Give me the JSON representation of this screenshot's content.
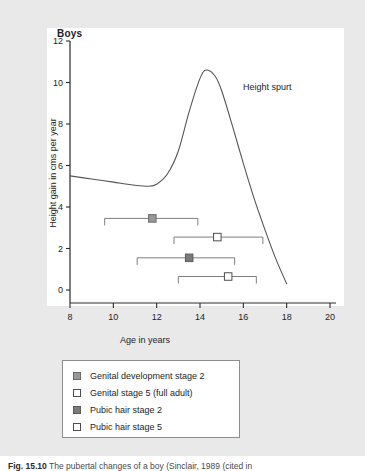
{
  "figure": {
    "title": "Boys",
    "caption_prefix": "Fig. 15.10",
    "caption_text": "The pubertal changes of a boy (Sinclair, 1989 (cited in"
  },
  "chart_data": {
    "type": "line",
    "title": "Boys",
    "xlabel": "Age in years",
    "ylabel": "Height gain in cms per year",
    "xlim": [
      8,
      20
    ],
    "ylim": [
      0,
      12
    ],
    "xticks": [
      8,
      10,
      12,
      14,
      16,
      18,
      20
    ],
    "yticks": [
      0,
      2,
      4,
      6,
      8,
      10,
      12
    ],
    "grid": false,
    "legend_position": "below-plot",
    "annotations": [
      {
        "text": "Height spurt",
        "x": 16.2,
        "y": 9.6
      }
    ],
    "series": [
      {
        "name": "Height velocity curve",
        "type": "line",
        "color": "#555555",
        "x": [
          8.0,
          9.0,
          10.0,
          11.0,
          11.6,
          12.0,
          12.5,
          13.0,
          13.5,
          14.0,
          14.3,
          14.7,
          15.0,
          15.5,
          16.0,
          16.5,
          17.0,
          17.5,
          18.0
        ],
        "y": [
          5.5,
          5.35,
          5.2,
          5.05,
          5.0,
          5.1,
          5.6,
          6.7,
          8.6,
          10.2,
          10.6,
          10.3,
          9.6,
          7.9,
          6.1,
          4.4,
          2.9,
          1.5,
          0.3
        ]
      }
    ],
    "stage_ranges": [
      {
        "name": "Genital development stage 2",
        "marker": "filled-light",
        "range_start": 9.6,
        "range_end": 13.9,
        "marker_age": 11.8,
        "row_y": 3.45
      },
      {
        "name": "Genital stage 5 (full adult)",
        "marker": "hollow",
        "range_start": 12.8,
        "range_end": 16.9,
        "marker_age": 14.8,
        "row_y": 2.55
      },
      {
        "name": "Pubic hair stage 2",
        "marker": "filled-dark",
        "range_start": 11.1,
        "range_end": 15.6,
        "marker_age": 13.5,
        "row_y": 1.55
      },
      {
        "name": "Pubic hair stage 5",
        "marker": "hollow",
        "range_start": 13.0,
        "range_end": 16.6,
        "marker_age": 15.3,
        "row_y": 0.65
      }
    ]
  },
  "legend": {
    "items": [
      {
        "label": "Genital development stage 2",
        "swatch": "filled-light"
      },
      {
        "label": "Genital stage 5 (full adult)",
        "swatch": "hollow"
      },
      {
        "label": "Pubic hair stage 2",
        "swatch": "filled-dark"
      },
      {
        "label": "Pubic hair stage 5",
        "swatch": "hollow"
      }
    ]
  }
}
